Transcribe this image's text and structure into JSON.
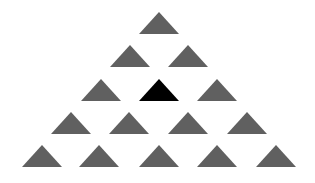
{
  "diagram": {
    "colors": {
      "default": "#606060",
      "highlight": "#000000",
      "background": "#ffffff"
    },
    "triangle_size": {
      "width": 40,
      "height": 22
    },
    "rows": [
      {
        "y": 12,
        "centers": [
          159
        ]
      },
      {
        "y": 45,
        "centers": [
          130,
          188
        ]
      },
      {
        "y": 79,
        "centers": [
          101,
          159,
          217
        ]
      },
      {
        "y": 112,
        "centers": [
          71,
          129,
          188,
          247
        ]
      },
      {
        "y": 145,
        "centers": [
          42,
          99,
          159,
          217,
          276
        ]
      }
    ],
    "highlighted": {
      "row": 2,
      "index": 1
    }
  }
}
